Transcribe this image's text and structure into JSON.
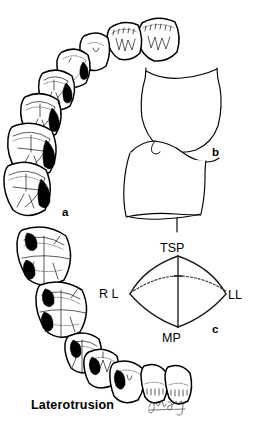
{
  "figure": {
    "caption": "Laterotrusion",
    "signature": "artist-signature",
    "background_color": "#ffffff",
    "ink_color": "#000000",
    "contact_color": "#000000"
  },
  "panels": [
    {
      "id": "a",
      "letter": "a",
      "name": "occlusal-arch-view",
      "description": "Occlusal view of dental arch with laterotrusive contact areas shaded black"
    },
    {
      "id": "b",
      "letter": "b",
      "name": "anterior-lateral-view",
      "description": "Lateral view of overlapping anterior teeth"
    },
    {
      "id": "c",
      "letter": "c",
      "name": "border-movement-diagram",
      "description": "Envelope of mandibular border movement in the frontal plane"
    }
  ],
  "envelope": {
    "labels": {
      "top": "TSP",
      "bottom": "MP",
      "left": "R L",
      "right": "LL"
    },
    "panel_letter": "c"
  },
  "arch": {
    "upper_teeth": [
      {
        "name": "upper-right-second-molar",
        "has_contact": true
      },
      {
        "name": "upper-right-first-molar",
        "has_contact": true
      },
      {
        "name": "upper-right-second-premolar",
        "has_contact": true
      },
      {
        "name": "upper-right-first-premolar",
        "has_contact": true
      },
      {
        "name": "upper-right-canine",
        "has_contact": false
      },
      {
        "name": "upper-right-lateral-incisor",
        "has_contact": false
      },
      {
        "name": "upper-right-central-incisor",
        "has_contact": false
      },
      {
        "name": "upper-left-central-incisor",
        "has_contact": false
      }
    ],
    "lower_teeth": [
      {
        "name": "lower-molar-upper",
        "has_contact": true
      },
      {
        "name": "lower-molar-lower",
        "has_contact": true
      },
      {
        "name": "lower-premolar",
        "has_contact": true
      },
      {
        "name": "lower-canine",
        "has_contact": true
      },
      {
        "name": "lower-lateral-incisor",
        "has_contact": true
      },
      {
        "name": "lower-central-incisor-1",
        "has_contact": false
      },
      {
        "name": "lower-central-incisor-2",
        "has_contact": false
      }
    ]
  }
}
